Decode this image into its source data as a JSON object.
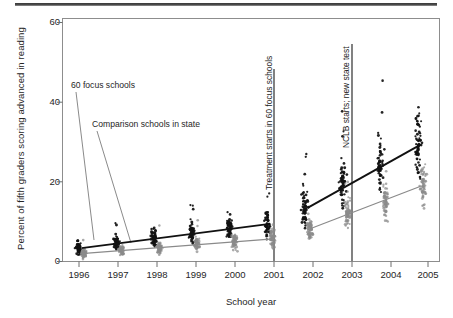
{
  "figure": {
    "name": "scatter-trend-figure",
    "has_top_rule": true
  },
  "chart_data": {
    "type": "scatter",
    "title": "",
    "xlabel": "School year",
    "ylabel": "Percent of fifth graders scoring advanced in reading",
    "xlim": [
      1995.5,
      2005.5
    ],
    "ylim": [
      0,
      62
    ],
    "xticks": [
      "1996",
      "1997",
      "1998",
      "1999",
      "2000",
      "2001",
      "2002",
      "2003",
      "2004",
      "2005"
    ],
    "yticks": [
      "0",
      "20",
      "40",
      "60"
    ],
    "grid": false,
    "legend_position": "inline-annotations",
    "series": [
      {
        "name": "60 focus schools",
        "color": "#111111",
        "marker": "filled-circle",
        "segments": [
          {
            "x": [
              1996,
              2001
            ],
            "y": [
              3.4,
              9.6
            ]
          },
          {
            "x": [
              2002,
              2005
            ],
            "y": [
              13.7,
              29.8
            ]
          }
        ],
        "yearly_mean": [
          3.4,
          4.6,
          5.9,
          7.1,
          8.3,
          9.6,
          13.7,
          19.1,
          24.4,
          29.8
        ]
      },
      {
        "name": "Comparison schools in state",
        "color": "#8a8a8a",
        "marker": "filled-circle",
        "segments": [
          {
            "x": [
              1996,
              2001
            ],
            "y": [
              2.0,
              5.7
            ]
          },
          {
            "x": [
              2002,
              2005
            ],
            "y": [
              8.1,
              19.2
            ]
          }
        ],
        "yearly_mean": [
          2.0,
          2.8,
          3.5,
          4.2,
          5.0,
          5.7,
          8.1,
          11.8,
          15.5,
          19.2
        ]
      }
    ],
    "annotations": [
      {
        "text": "60 focus schools",
        "orientation": "horizontal",
        "target_series": "60 focus schools"
      },
      {
        "text": "Comparison schools in state",
        "orientation": "horizontal",
        "target_series": "Comparison schools in state"
      },
      {
        "text": "Treatment starts in 60 focus schools",
        "orientation": "vertical",
        "at_x": 2001
      },
      {
        "text": "NCLB starts; new state test",
        "orientation": "vertical",
        "at_x": 2003
      }
    ]
  }
}
